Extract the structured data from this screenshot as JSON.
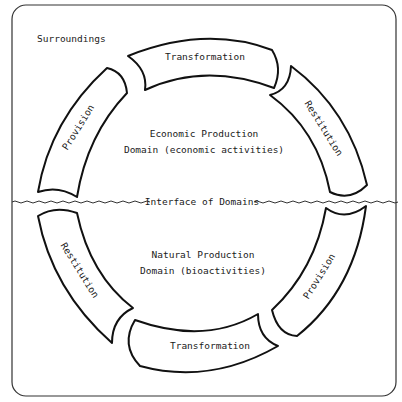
{
  "frame_label": "Surroundings",
  "upper_domain": {
    "line1": "Economic Production",
    "line2": "Domain (economic activities)"
  },
  "lower_domain": {
    "line1": "Natural Production",
    "line2": "Domain (bioactivities)"
  },
  "interface_label": "Interface of Domains",
  "arrows": {
    "top": "Transformation",
    "upper_right": "Restitution",
    "upper_left": "Provision",
    "lower_left": "Restitution",
    "lower_right": "Provision",
    "bottom": "Transformation"
  }
}
